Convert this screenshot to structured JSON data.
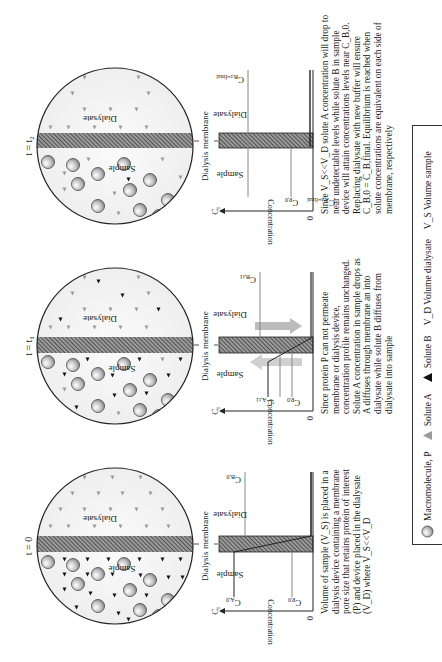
{
  "figure": {
    "panels": [
      {
        "time_label": "t = 0",
        "sample_label": "Sample",
        "dialysate_label": "Dialysate",
        "membrane_label": "Dialysis membrane",
        "graph": {
          "y_axis_label": "Concentration",
          "y_axis_symbol": "C_i",
          "origin_label": "0",
          "left_region": "Sample",
          "right_region": "Dialysate",
          "line_labels": [
            "C_A,0",
            "C_P,0",
            "C_B,0"
          ]
        },
        "description": "Volume of sample (V_S) is placed in a dialysis device containing a membrane pore size that retains protein of interest (P) and device placed in the dialysate (V_D) where V_S<<V_D"
      },
      {
        "time_label": "t = t1",
        "sample_label": "Sample",
        "dialysate_label": "Dialysate",
        "membrane_label": "Dialysis membrane",
        "graph": {
          "y_axis_label": "Concentration",
          "y_axis_symbol": "C_i",
          "origin_label": "0",
          "left_region": "Sample",
          "right_region": "Dialysate",
          "line_labels": [
            "C_A,t1",
            "C_P,0",
            "C_B,t1"
          ]
        },
        "description": "Since protein P can not permeate membrane or dialysis device, concentration profile remains unchanged. Solute A concentration in sample drops as A diffuses through membrane an into dialysate while solute B diffuses from dialysate into sample"
      },
      {
        "time_label": "t = t2",
        "sample_label": "Sample",
        "dialysate_label": "Dialysate",
        "membrane_label": "Dialysis membrane",
        "graph": {
          "y_axis_label": "Concentration",
          "y_axis_symbol": "C_i",
          "origin_label": "0",
          "left_region": "Sample",
          "right_region": "Dialysate",
          "line_labels": [
            "C_A,t=final",
            "C_P,0",
            "C_B,t=final"
          ]
        },
        "description": "Since V_S<<V_D solute A concentration will drop to near undetectable levels while solute B in sample device will attain concentrations levels near C_B,0. Replacing dialysate with new buffer will ensure C_B,0 = C_B,final. Equilibrium is reached when solute concentrations are equivalent on each side of membrane, respectively"
      }
    ],
    "legend": {
      "items": [
        {
          "icon": "macromolecule-sphere",
          "label": "Macromolecule, P"
        },
        {
          "icon": "gray-triangle",
          "label": "Solute A"
        },
        {
          "icon": "black-triangle",
          "label": "Solute B"
        },
        {
          "icon": "none",
          "label": "V_D Volume dialysate"
        },
        {
          "icon": "none",
          "label": "V_S Volume sample"
        }
      ]
    },
    "colors": {
      "membrane_hatch": "#555555",
      "circle_fill": "#f3f3f3",
      "solute_a": "#9a9a9a",
      "solute_b": "#111111",
      "macromolecule": "#bdbdbd",
      "arrow_fill": "#bcbcbc"
    }
  }
}
